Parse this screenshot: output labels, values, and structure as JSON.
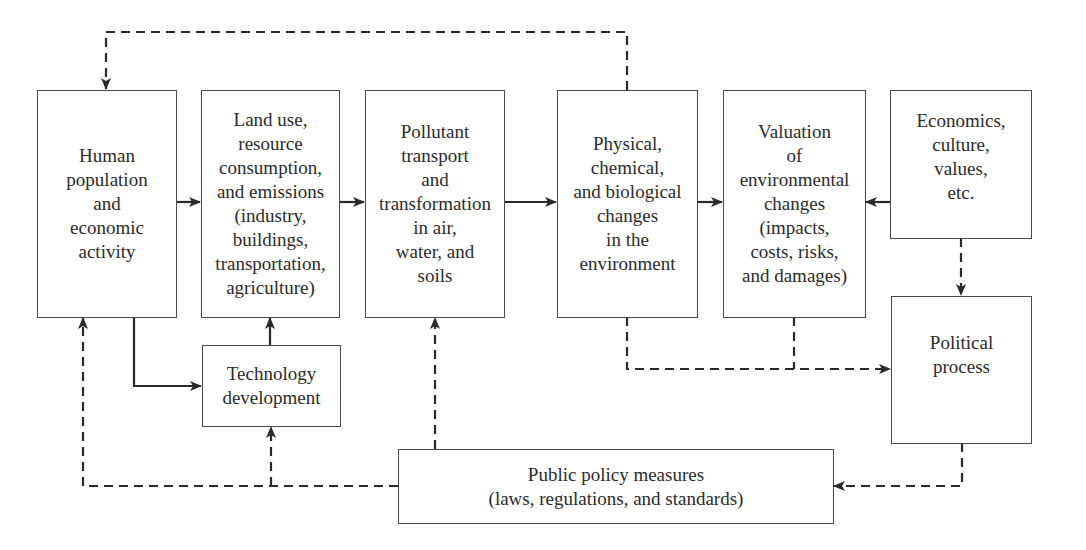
{
  "diagram": {
    "nodes": {
      "human": {
        "label": "Human\npopulation\nand\neconomic\nactivity"
      },
      "land_use": {
        "label": "Land use,\nresource\nconsumption,\nand emissions\n(industry,\nbuildings,\ntransportation,\nagriculture)"
      },
      "pollutant": {
        "label": "Pollutant\ntransport\nand\ntransformation\nin air,\nwater, and\nsoils"
      },
      "physical": {
        "label": "Physical,\nchemical,\nand biological\nchanges\nin the\nenvironment"
      },
      "valuation": {
        "label": "Valuation\nof\nenvironmental\nchanges\n(impacts,\ncosts, risks,\nand damages)"
      },
      "economics": {
        "label": "Economics,\nculture,\nvalues,\netc."
      },
      "technology": {
        "label": "Technology\ndevelopment"
      },
      "political": {
        "label": "Political\nprocess"
      },
      "policy": {
        "label": "Public policy measures\n(laws, regulations, and standards)"
      }
    },
    "edges": [
      {
        "from": "human",
        "to": "land_use",
        "style": "solid"
      },
      {
        "from": "land_use",
        "to": "pollutant",
        "style": "solid"
      },
      {
        "from": "pollutant",
        "to": "physical",
        "style": "solid"
      },
      {
        "from": "physical",
        "to": "valuation",
        "style": "solid"
      },
      {
        "from": "economics",
        "to": "valuation",
        "style": "solid"
      },
      {
        "from": "human",
        "to": "technology",
        "style": "solid"
      },
      {
        "from": "technology",
        "to": "land_use",
        "style": "solid"
      },
      {
        "from": "physical",
        "to": "human",
        "style": "dashed"
      },
      {
        "from": "economics",
        "to": "political",
        "style": "dashed"
      },
      {
        "from": "physical",
        "to": "political",
        "style": "dashed"
      },
      {
        "from": "valuation",
        "to": "political",
        "style": "dashed"
      },
      {
        "from": "political",
        "to": "policy",
        "style": "dashed"
      },
      {
        "from": "policy",
        "to": "pollutant",
        "style": "dashed"
      },
      {
        "from": "policy",
        "to": "technology",
        "style": "dashed"
      },
      {
        "from": "policy",
        "to": "human",
        "style": "dashed"
      }
    ],
    "colors": {
      "line": "#2a2a2a",
      "border": "#4a4a4a",
      "text": "#2b2b2b",
      "background": "#ffffff"
    }
  }
}
